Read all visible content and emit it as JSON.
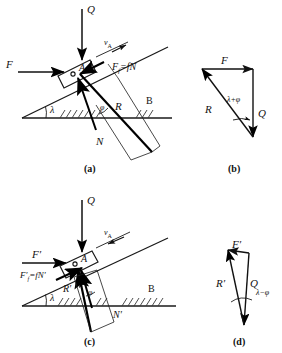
{
  "figure": {
    "panels": [
      {
        "id": "a",
        "caption": "(a)",
        "description": "Block A sliding up an incline of angle lambda under applied horizontal force F and vertical load Q",
        "labels": {
          "load": "Q",
          "applied_force": "F",
          "velocity": "v",
          "velocity_sub": "A",
          "friction": "F",
          "friction_sub": "f",
          "friction_eq": "=fN",
          "block": "A",
          "resultant": "R",
          "normal": "N",
          "incline_angle": "λ",
          "friction_angle": "φ",
          "base_point": "B"
        }
      },
      {
        "id": "b",
        "caption": "(b)",
        "description": "Closed force triangle for case (a): F, Q and R with angle lambda plus phi",
        "labels": {
          "applied_force": "F",
          "load": "Q",
          "resultant": "R",
          "angle": "λ+φ"
        }
      },
      {
        "id": "c",
        "caption": "(c)",
        "description": "Block A sliding down the incline; friction reverses direction",
        "labels": {
          "load": "Q",
          "applied_force": "F′",
          "velocity": "v",
          "velocity_sub": "A",
          "friction": "F′",
          "friction_sub": "f",
          "friction_eq": "=fN′",
          "block": "A",
          "resultant": "R′",
          "normal": "N′",
          "incline_angle": "λ",
          "friction_angle": "φ",
          "base_point": "B"
        }
      },
      {
        "id": "d",
        "caption": "(d)",
        "description": "Closed force triangle for case (c): F-prime, Q and R-prime with angle lambda minus phi",
        "labels": {
          "applied_force": "F′",
          "load": "Q",
          "resultant": "R′",
          "angle": "λ−φ"
        }
      }
    ]
  },
  "style": {
    "line_color": "#1a1a1a",
    "thick_color": "#000000",
    "hatch_color": "#3a3a3a",
    "background": "#ffffff"
  }
}
